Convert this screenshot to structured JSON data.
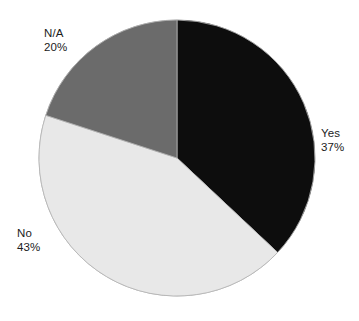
{
  "background_color": "#ffffff",
  "chart_data": {
    "type": "pie",
    "title": "",
    "subtitle": "",
    "xlabel": "",
    "ylabel": "",
    "legend_position": "none",
    "grid": false,
    "labels_inline": true,
    "start_angle_deg": 0,
    "direction": "clockwise",
    "categories": [
      "Yes",
      "No",
      "N/A"
    ],
    "values": [
      37,
      43,
      20
    ],
    "value_unit": "%",
    "colors": [
      "#0d0d0d",
      "#e8e8e8",
      "#6b6b6b"
    ],
    "outline_color": "#b4b4b4",
    "slices": [
      {
        "name": "Yes",
        "value": 37,
        "label": "Yes",
        "value_label": "37%",
        "color": "#0d0d0d",
        "start_deg": 0,
        "end_deg": 133.2
      },
      {
        "name": "No",
        "value": 43,
        "label": "No",
        "value_label": "43%",
        "color": "#e8e8e8",
        "start_deg": 133.2,
        "end_deg": 288.0
      },
      {
        "name": "N/A",
        "value": 20,
        "label": "N/A",
        "value_label": "20%",
        "color": "#6b6b6b",
        "start_deg": 288.0,
        "end_deg": 360.0
      }
    ],
    "geometry": {
      "center_x": 177,
      "center_y": 158,
      "radius": 138
    }
  }
}
